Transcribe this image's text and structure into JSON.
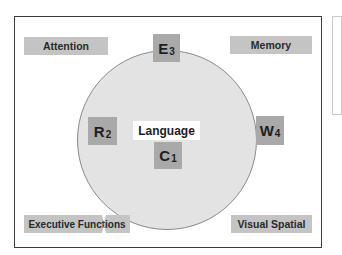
{
  "diagram": {
    "center": {
      "label": "Language"
    },
    "components": [
      {
        "letter": "E",
        "subscript": "3"
      },
      {
        "letter": "R",
        "subscript": "2"
      },
      {
        "letter": "C",
        "subscript": "1"
      },
      {
        "letter": "W",
        "subscript": "4"
      }
    ],
    "domains": {
      "top_left": "Attention",
      "top_right": "Memory",
      "bottom_left": "Executive Functions",
      "bottom_right": "Visual Spatial"
    },
    "colors": {
      "frame_border": "#3a3a3a",
      "circle_fill": "#e3e3e3",
      "domain_box": "#c4c4c4",
      "component_box": "#a9a9a9",
      "center_box": "#ffffff"
    }
  }
}
